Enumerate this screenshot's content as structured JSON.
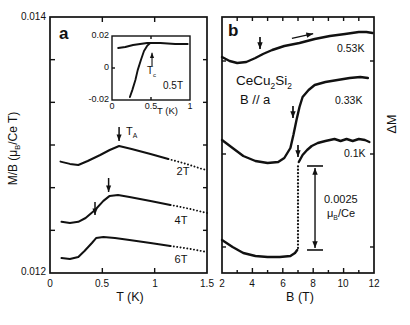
{
  "figure_labels": {
    "panel_a": {
      "letter": "a",
      "ylabel": {
        "pre": "M/B (μ",
        "sub": "B",
        "post": "/Ce T)"
      },
      "ytick_top": "0.014",
      "ytick_bottom": "0.012",
      "xticks": [
        "0",
        "0.5",
        "1",
        "1.5"
      ],
      "xlabel": "T (K)",
      "curve_labels": {
        "c2": "2T",
        "c4": "4T",
        "c6": "6T"
      },
      "ta": {
        "pre": "T",
        "sub": "A"
      },
      "inset": {
        "yticks": [
          "0.02",
          "0",
          "-0.02"
        ],
        "xticks": [
          "0",
          "0.5",
          "1"
        ],
        "xlabel": "T (K)",
        "tc": {
          "pre": "T",
          "sub": "c"
        },
        "field": "0.5T"
      }
    },
    "panel_b": {
      "letter": "b",
      "material": {
        "p1": "CeCu",
        "s1": "2",
        "p2": "Si",
        "s2": "2"
      },
      "orientation": "B // a",
      "curve_labels": {
        "k053": "0.53K",
        "k033": "0.33K",
        "k01": "0.1K"
      },
      "scale_value": "0.0025",
      "scale_unit": {
        "pre": "μ",
        "sub": "B",
        "post": "/Ce"
      },
      "xticks": [
        "2",
        "4",
        "6",
        "8",
        "10",
        "12"
      ],
      "xlabel": "B (T)",
      "ylabel": "ΔM"
    },
    "colors": {
      "ink": "#111111",
      "background": "#ffffff"
    }
  },
  "chart_data": [
    {
      "id": "panel-a-main",
      "type": "line",
      "title": "Panel a: magnetization M/B vs temperature at fixed fields",
      "xlabel": "T (K)",
      "ylabel": "M/B (μB/Ce T)",
      "xlim": [
        0,
        1.5
      ],
      "ylim": [
        0.012,
        0.014
      ],
      "frame_w": 1.7,
      "ticks": [
        {
          "edge": "bottom",
          "values": [
            0.5,
            1
          ],
          "len": 5
        },
        {
          "edge": "top",
          "values": [
            0.5,
            1
          ],
          "len": 5
        },
        {
          "edge": "left",
          "values": [
            0.0123333,
            0.0126667,
            0.013,
            0.0133333,
            0.0136667
          ],
          "len": 5
        },
        {
          "edge": "right",
          "values": [
            0.0123333,
            0.0126667,
            0.013,
            0.0133333,
            0.0136667
          ],
          "len": 4
        }
      ],
      "series": [
        {
          "name": "2T",
          "w": 2.0,
          "x": [
            0.1,
            0.19,
            0.27,
            0.36,
            0.48,
            0.57,
            0.66,
            0.78,
            0.96,
            1.13
          ],
          "y": [
            0.01287,
            0.012852,
            0.012844,
            0.012875,
            0.012922,
            0.012961,
            0.012992,
            0.012969,
            0.01293,
            0.012891
          ]
        },
        {
          "name": "2T-tail",
          "style": "dotted",
          "w": 1.9,
          "x": [
            1.13,
            1.22,
            1.3,
            1.38,
            1.45,
            1.5
          ],
          "y": [
            0.012891,
            0.012871,
            0.012852,
            0.012832,
            0.012813,
            0.012805
          ]
        },
        {
          "name": "4T",
          "w": 2.0,
          "x": [
            0.11,
            0.19,
            0.27,
            0.34,
            0.43,
            0.51,
            0.57,
            0.65,
            0.76,
            0.96,
            1.15
          ],
          "y": [
            0.0124,
            0.012391,
            0.0124,
            0.01243,
            0.012492,
            0.012563,
            0.012602,
            0.012609,
            0.012594,
            0.012563,
            0.012531
          ]
        },
        {
          "name": "4T-tail",
          "style": "dotted",
          "w": 1.9,
          "x": [
            1.15,
            1.25,
            1.34,
            1.42,
            1.5
          ],
          "y": [
            0.012531,
            0.012516,
            0.0125,
            0.012484,
            0.012469
          ]
        },
        {
          "name": "6T",
          "w": 2.0,
          "x": [
            0.11,
            0.19,
            0.27,
            0.33,
            0.4,
            0.44,
            0.51,
            0.62,
            0.76,
            0.96,
            1.15
          ],
          "y": [
            0.012117,
            0.012109,
            0.012125,
            0.012172,
            0.012234,
            0.012273,
            0.012281,
            0.012273,
            0.012258,
            0.012234,
            0.012211
          ]
        },
        {
          "name": "6T-tail",
          "style": "dotted",
          "w": 1.9,
          "x": [
            1.15,
            1.25,
            1.34,
            1.42,
            1.5
          ],
          "y": [
            0.012211,
            0.012199,
            0.012188,
            0.012176,
            0.012164
          ]
        }
      ],
      "annotations": [
        {
          "kind": "arrow",
          "label": "T_A at 2T",
          "x1": 0.66,
          "y1": 0.013141,
          "x2": 0.66,
          "y2": 0.013031,
          "w": 1.5,
          "head": 3.4
        },
        {
          "kind": "arrow",
          "label": "T_A at 4T",
          "x1": 0.56,
          "y1": 0.012742,
          "x2": 0.56,
          "y2": 0.012633,
          "w": 1.5,
          "head": 3.4
        },
        {
          "kind": "arrow",
          "label": "T_A at 6T",
          "x1": 0.43,
          "y1": 0.012555,
          "x2": 0.43,
          "y2": 0.012453,
          "w": 1.5,
          "head": 3.4
        }
      ]
    },
    {
      "id": "panel-a-inset",
      "type": "line",
      "title": "Inset: superconducting transition at 0.5T",
      "xlabel": "T (K)",
      "ylabel": "",
      "xlim": [
        0,
        1
      ],
      "ylim": [
        -0.02,
        0.02
      ],
      "frame_w": 1.4,
      "ticks": [
        {
          "edge": "bottom",
          "values": [
            0.5
          ],
          "len": 3
        },
        {
          "edge": "top",
          "values": [
            0.5
          ],
          "len": 3
        },
        {
          "edge": "left",
          "values": [
            0
          ],
          "len": 3
        }
      ],
      "series": [
        {
          "name": "normal-state",
          "w": 1.9,
          "x": [
            0.08,
            0.17,
            0.27,
            0.36,
            0.45,
            0.62,
            0.81,
            0.97
          ],
          "y": [
            0.0125,
            0.0131,
            0.0144,
            0.015,
            0.0156,
            0.0156,
            0.015,
            0.015
          ]
        },
        {
          "name": "diamagnetic",
          "w": 1.9,
          "x": [
            0.23,
            0.26,
            0.3,
            0.33,
            0.37,
            0.41,
            0.45,
            0.49
          ],
          "y": [
            -0.0181,
            -0.0138,
            -0.0075,
            -0.0013,
            0.005,
            0.0106,
            0.0138,
            0.0156
          ]
        }
      ],
      "annotations": [
        {
          "kind": "arrow",
          "label": "T_c",
          "x1": 0.513,
          "y1": 0.00125,
          "x2": 0.513,
          "y2": 0.0095,
          "w": 1.1,
          "head": 2.8
        }
      ]
    },
    {
      "id": "panel-b",
      "type": "line",
      "title": "Panel b: ΔM vs field B at fixed temperatures, B // a",
      "xlabel": "B (T)",
      "ylabel": "ΔM (scale bar 0.0025 μB/Ce)",
      "xlim": [
        2,
        12
      ],
      "ylim": [
        0,
        0.008
      ],
      "frame_w": 1.7,
      "ticks": [
        {
          "edge": "bottom",
          "values": [
            4,
            6,
            8,
            10
          ],
          "len": 5
        },
        {
          "edge": "bottom",
          "values": [
            3,
            5,
            7,
            9,
            11
          ],
          "len": 3
        },
        {
          "edge": "top",
          "values": [
            3,
            4,
            5,
            6,
            7,
            8,
            9,
            10,
            11
          ],
          "len": 4
        },
        {
          "edge": "left",
          "values": [
            0.000813,
            0.003719,
            0.006625
          ],
          "len": 4
        },
        {
          "edge": "right",
          "values": [
            0.000813,
            0.003719,
            0.006625
          ],
          "len": 4
        }
      ],
      "series": [
        {
          "name": "0.53K",
          "w": 2.4,
          "x": [
            2.0,
            2.5,
            3.0,
            3.6,
            4.2,
            4.7,
            5.3,
            6.1,
            7.1,
            8.1,
            9.1,
            10.1,
            11.0,
            11.5,
            11.9
          ],
          "y": [
            0.00675,
            0.006625,
            0.006563,
            0.006594,
            0.006719,
            0.006844,
            0.006969,
            0.007094,
            0.007188,
            0.007313,
            0.007406,
            0.007469,
            0.007531,
            0.007531,
            0.0075
          ]
        },
        {
          "name": "0.33K",
          "w": 2.4,
          "x": [
            2.0,
            2.7,
            3.4,
            4.2,
            5.0,
            5.7,
            6.1,
            6.5,
            6.7,
            6.9,
            7.1,
            7.3,
            7.7,
            8.1,
            8.8,
            9.6,
            10.4,
            11.1,
            11.6
          ],
          "y": [
            0.004156,
            0.003906,
            0.003656,
            0.0035,
            0.003438,
            0.003469,
            0.003594,
            0.003906,
            0.004313,
            0.004781,
            0.005188,
            0.0055,
            0.005719,
            0.005875,
            0.005969,
            0.006031,
            0.006094,
            0.006125,
            0.006094
          ]
        },
        {
          "name": "0.1K-low",
          "w": 2.4,
          "x": [
            2.0,
            2.7,
            3.4,
            4.2,
            5.0,
            5.8,
            6.5,
            6.8,
            6.95
          ],
          "y": [
            0.001031,
            0.000813,
            0.000625,
            0.000531,
            0.0005,
            0.0005,
            0.000531,
            0.000625,
            0.000719
          ]
        },
        {
          "name": "0.1K-jump",
          "style": "dotted",
          "w": 2.2,
          "x": [
            7.0,
            7.0
          ],
          "y": [
            0.000781,
            0.003375
          ]
        },
        {
          "name": "0.1K-high",
          "w": 2.4,
          "x": [
            7.05,
            7.3,
            7.6,
            7.9,
            8.3,
            8.8,
            9.4,
            9.8,
            10.2,
            10.6,
            11.0,
            11.4,
            11.7
          ],
          "y": [
            0.003469,
            0.003688,
            0.003844,
            0.003969,
            0.004063,
            0.004125,
            0.004188,
            0.004125,
            0.004188,
            0.004125,
            0.004188,
            0.004156,
            0.004094
          ]
        }
      ],
      "annotations": [
        {
          "kind": "arrow",
          "label": "B_A at 0.53K",
          "x1": 4.5,
          "y1": 0.007375,
          "x2": 4.5,
          "y2": 0.007,
          "w": 1.7,
          "head": 3.6
        },
        {
          "kind": "arrow",
          "label": "B_A at 0.33K",
          "x1": 6.67,
          "y1": 0.005219,
          "x2": 6.67,
          "y2": 0.004844,
          "w": 1.7,
          "head": 3.6
        },
        {
          "kind": "arrow",
          "label": "B_A at 0.1K",
          "x1": 7.0,
          "y1": 0.004,
          "x2": 7.0,
          "y2": 0.003625,
          "w": 1.7,
          "head": 3.6
        },
        {
          "kind": "arrow",
          "label": "field sweep direction",
          "x1": 6.6,
          "y1": 0.00733,
          "x2": 8.0,
          "y2": 0.00748,
          "w": 1.3,
          "head": 3.6
        },
        {
          "kind": "varrow2",
          "label": "magnetization scale bar",
          "x": 8.12,
          "y1": 0.000781,
          "y2": 0.003281,
          "w": 1.4,
          "head": 3.6
        },
        {
          "kind": "cap",
          "x": 8.12,
          "y": 0.003344,
          "halfw": 8
        },
        {
          "kind": "cap",
          "x": 8.12,
          "y": 0.000719,
          "halfw": 8
        }
      ]
    }
  ]
}
